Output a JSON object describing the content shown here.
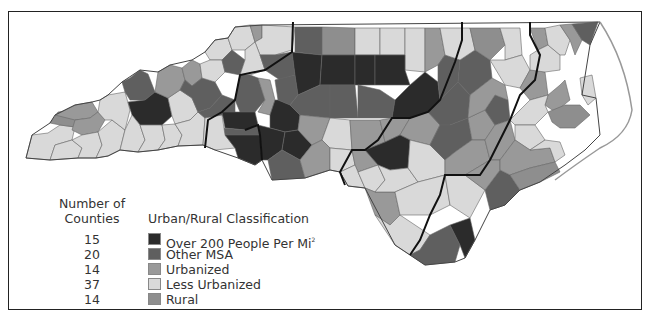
{
  "legend": {
    "counts_header": "Number of Counties",
    "counts_header_line1": "Number of",
    "counts_header_line2": "Counties",
    "class_header": "Urban/Rural Classification",
    "items": [
      {
        "count": "15",
        "label": "Over 200 People Per Mi",
        "superscript": "2",
        "color": "#2b2b2b"
      },
      {
        "count": "20",
        "label": "Other MSA",
        "superscript": "",
        "color": "#5f5f5f"
      },
      {
        "count": "14",
        "label": "Urbanized",
        "superscript": "",
        "color": "#999999"
      },
      {
        "count": "37",
        "label": "Less Urbanized",
        "superscript": "",
        "color": "#d9d9d9"
      },
      {
        "count": "14",
        "label": "Rural",
        "superscript": "",
        "color": "#8e8e8e"
      }
    ]
  },
  "map": {
    "region": "North Carolina counties",
    "border_color": "#555555",
    "region_boundary_color": "#111111",
    "frame_color": "#222222"
  }
}
